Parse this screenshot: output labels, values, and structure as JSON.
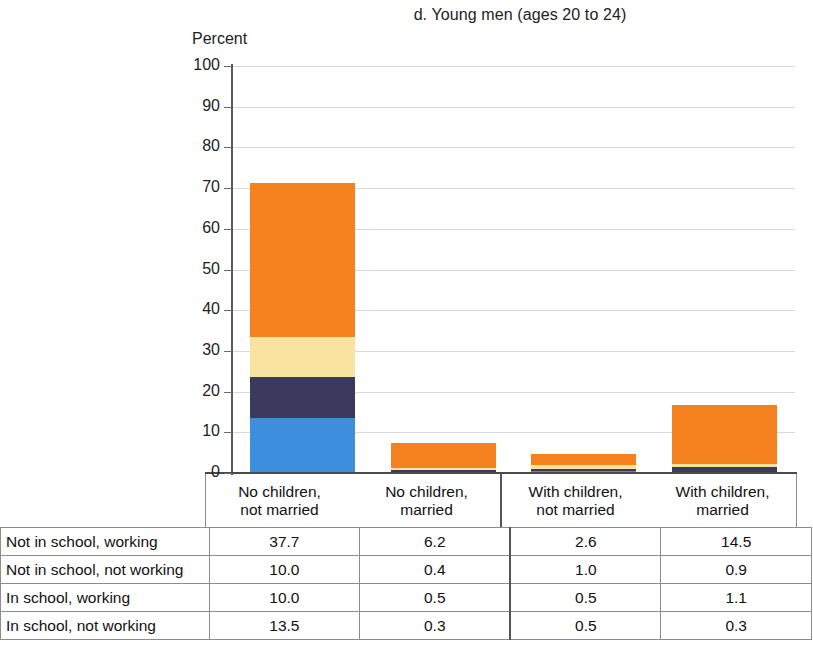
{
  "chart_data": {
    "type": "bar",
    "subtype": "stacked-bar",
    "title": "d. Young men (ages 20 to 24)",
    "ylabel": "Percent",
    "xlabel": "",
    "ylim": [
      0,
      100
    ],
    "yticks": [
      0,
      10,
      20,
      30,
      40,
      50,
      60,
      70,
      80,
      90,
      100
    ],
    "grid": true,
    "legend_position": "table-below",
    "categories": [
      "No children, not married",
      "No children, married",
      "With children, not married",
      "With children, married"
    ],
    "category_lines": [
      [
        "No children,",
        "not married"
      ],
      [
        "No children,",
        "married"
      ],
      [
        "With children,",
        "not married"
      ],
      [
        "With children,",
        "married"
      ]
    ],
    "series": [
      {
        "name": "In school, not working",
        "color": "#3E8EDE",
        "values": [
          13.5,
          0.3,
          0.5,
          0.3
        ]
      },
      {
        "name": "In school, working",
        "color": "#3A3A5C",
        "values": [
          10.0,
          0.5,
          0.5,
          1.1
        ]
      },
      {
        "name": "Not in school, not working",
        "color": "#F8E3A0",
        "values": [
          10.0,
          0.4,
          1.0,
          0.9
        ]
      },
      {
        "name": "Not in school, working",
        "color": "#F5821F",
        "values": [
          37.7,
          6.2,
          2.6,
          14.5
        ]
      }
    ],
    "stack_totals": [
      71.2,
      7.4,
      4.6,
      16.8
    ]
  },
  "table": {
    "rows": [
      {
        "label": "Not in school, working",
        "values": [
          "37.7",
          "6.2",
          "2.6",
          "14.5"
        ]
      },
      {
        "label": "Not in school, not working",
        "values": [
          "10.0",
          "0.4",
          "1.0",
          "0.9"
        ]
      },
      {
        "label": "In school, working",
        "values": [
          "10.0",
          "0.5",
          "0.5",
          "1.1"
        ]
      },
      {
        "label": "In school, not working",
        "values": [
          "13.5",
          "0.3",
          "0.5",
          "0.3"
        ]
      }
    ]
  },
  "colors": {
    "orange": "#F5821F",
    "pale_yellow": "#F8E3A0",
    "navy": "#3A3A5C",
    "blue": "#3E8EDE",
    "gridline": "#d9d9d9",
    "axis": "#4a4a4a"
  }
}
